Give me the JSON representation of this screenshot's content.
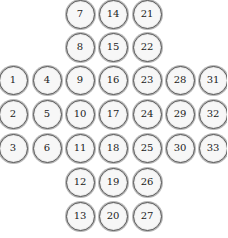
{
  "board": {
    "type": "peg-solitaire-cross",
    "colors": {
      "ring": "#555555",
      "outer_ring": "#b8b8b8",
      "fill": "#f7f7f7",
      "text": "#222222"
    },
    "col_x": [
      13,
      47,
      80,
      113,
      147,
      180,
      213
    ],
    "row_y": [
      14,
      47,
      80,
      114,
      148,
      182,
      216
    ],
    "pegs": [
      {
        "label": "1",
        "col": 0,
        "row": 2
      },
      {
        "label": "2",
        "col": 0,
        "row": 3
      },
      {
        "label": "3",
        "col": 0,
        "row": 4
      },
      {
        "label": "4",
        "col": 1,
        "row": 2
      },
      {
        "label": "5",
        "col": 1,
        "row": 3
      },
      {
        "label": "6",
        "col": 1,
        "row": 4
      },
      {
        "label": "7",
        "col": 2,
        "row": 0
      },
      {
        "label": "8",
        "col": 2,
        "row": 1
      },
      {
        "label": "9",
        "col": 2,
        "row": 2
      },
      {
        "label": "10",
        "col": 2,
        "row": 3
      },
      {
        "label": "11",
        "col": 2,
        "row": 4
      },
      {
        "label": "12",
        "col": 2,
        "row": 5
      },
      {
        "label": "13",
        "col": 2,
        "row": 6
      },
      {
        "label": "14",
        "col": 3,
        "row": 0
      },
      {
        "label": "15",
        "col": 3,
        "row": 1
      },
      {
        "label": "16",
        "col": 3,
        "row": 2
      },
      {
        "label": "17",
        "col": 3,
        "row": 3
      },
      {
        "label": "18",
        "col": 3,
        "row": 4
      },
      {
        "label": "19",
        "col": 3,
        "row": 5
      },
      {
        "label": "20",
        "col": 3,
        "row": 6
      },
      {
        "label": "21",
        "col": 4,
        "row": 0
      },
      {
        "label": "22",
        "col": 4,
        "row": 1
      },
      {
        "label": "23",
        "col": 4,
        "row": 2
      },
      {
        "label": "24",
        "col": 4,
        "row": 3
      },
      {
        "label": "25",
        "col": 4,
        "row": 4
      },
      {
        "label": "26",
        "col": 4,
        "row": 5
      },
      {
        "label": "27",
        "col": 4,
        "row": 6
      },
      {
        "label": "28",
        "col": 5,
        "row": 2
      },
      {
        "label": "29",
        "col": 5,
        "row": 3
      },
      {
        "label": "30",
        "col": 5,
        "row": 4
      },
      {
        "label": "31",
        "col": 6,
        "row": 2
      },
      {
        "label": "32",
        "col": 6,
        "row": 3
      },
      {
        "label": "33",
        "col": 6,
        "row": 4
      }
    ]
  }
}
